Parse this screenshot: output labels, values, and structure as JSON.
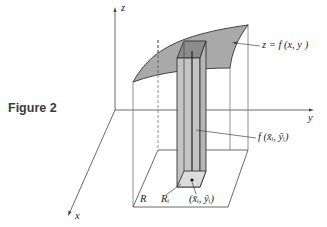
{
  "figure": {
    "caption": "Figure 2",
    "axes": {
      "z": "z",
      "y": "y",
      "x": "x"
    },
    "labels": {
      "surface": "z = f (x, y )",
      "height": "f (x̄ᵢ, ȳᵢ)",
      "region": "R",
      "subregion": "Rᵢ",
      "sample_point": "(x̄ᵢ, ȳᵢ)"
    },
    "colors": {
      "surface_fill": "#a9a9a9",
      "column_fill": "#c4c4c4",
      "column_top": "#8c8c8c",
      "line": "#333333",
      "light_line": "#777777"
    }
  }
}
